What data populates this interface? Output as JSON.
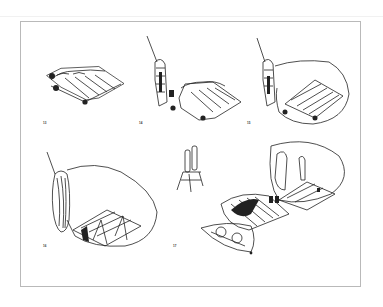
{
  "page": {
    "type": "scanned-illustration-plate",
    "background": "#ffffff",
    "frame_color": "#b9b9b9",
    "ink_color": "#222222"
  },
  "figures": [
    {
      "number": "13",
      "caption": "13",
      "description": "Cushion/mattress platform with straps, objects at corners"
    },
    {
      "number": "14",
      "caption": "14",
      "description": "Standing figure with rod beside platform"
    },
    {
      "number": "15",
      "caption": "15",
      "description": "Figure with rod, platform enclosed by inflated membrane"
    },
    {
      "number": "16",
      "caption": "16",
      "description": "Coiled rolled-up membrane with enclosure and floor grid"
    },
    {
      "number": "17",
      "caption": "17",
      "description": "Unfolded enclosure sequence with standing person, sleeping figure, and twin-tank apparatus"
    }
  ]
}
